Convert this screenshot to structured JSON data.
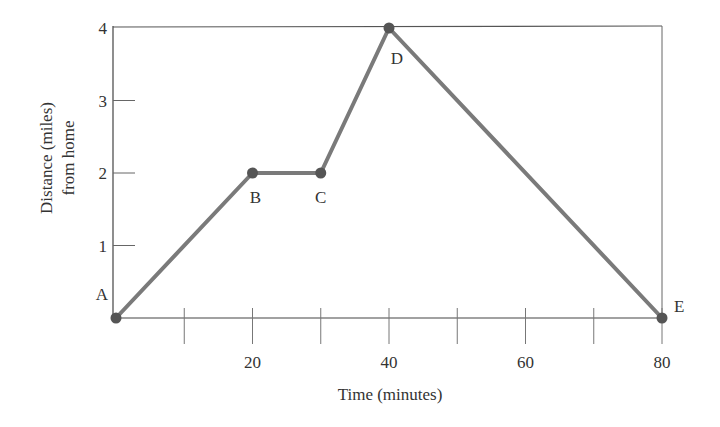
{
  "chart_data": {
    "type": "line",
    "title": "",
    "xlabel": "Time (minutes)",
    "ylabel_lines": [
      "Distance (miles)",
      "from home"
    ],
    "ylabel": "Distance (miles) from home",
    "xlim": [
      0,
      80
    ],
    "ylim": [
      0,
      4
    ],
    "x_ticks": [
      10,
      20,
      30,
      40,
      50,
      60,
      70,
      80
    ],
    "x_tick_labels": [
      "",
      "20",
      "",
      "40",
      "",
      "60",
      "",
      "80"
    ],
    "y_ticks": [
      1,
      2,
      3,
      4
    ],
    "y_tick_labels": [
      "1",
      "2",
      "3",
      "4"
    ],
    "grid": false,
    "legend": null,
    "series": [
      {
        "name": "distance",
        "points": [
          {
            "label": "A",
            "x": 0,
            "y": 0
          },
          {
            "label": "B",
            "x": 20,
            "y": 2
          },
          {
            "label": "C",
            "x": 30,
            "y": 2
          },
          {
            "label": "D",
            "x": 40,
            "y": 4
          },
          {
            "label": "E",
            "x": 80,
            "y": 0
          }
        ]
      }
    ],
    "x": [
      0,
      20,
      30,
      40,
      80
    ],
    "values": [
      0,
      2,
      2,
      4,
      0
    ],
    "point_labels": [
      "A",
      "B",
      "C",
      "D",
      "E"
    ],
    "colors": {
      "line": "#7a7a7a",
      "marker": "#555555",
      "axis": "#444444",
      "text": "#333333"
    }
  }
}
